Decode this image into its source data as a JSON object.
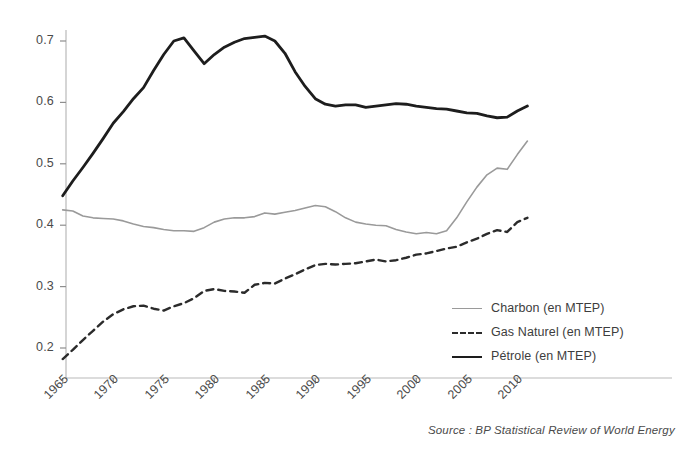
{
  "chart_data": {
    "type": "line",
    "title": "",
    "subtitle": "",
    "xlabel": "",
    "ylabel": "",
    "xlim": [
      1965,
      2011
    ],
    "ylim": [
      0.15,
      0.73
    ],
    "grid": false,
    "legend_position": "inside-right-lower",
    "source_note": "Source : BP Statistical Review of World Energy",
    "xticks": [
      1965,
      1970,
      1975,
      1980,
      1985,
      1990,
      1995,
      2000,
      2005,
      2010
    ],
    "xtick_labels": [
      "1965",
      "1970",
      "1975",
      "1980",
      "1985",
      "1990",
      "1995",
      "2000",
      "2005",
      "2010"
    ],
    "yticks": [
      0.2,
      0.3,
      0.4,
      0.5,
      0.6,
      0.7
    ],
    "ytick_labels": [
      "0.2",
      "0.3",
      "0.4",
      "0.5",
      "0.6",
      "0.7"
    ],
    "x": [
      1965,
      1966,
      1967,
      1968,
      1969,
      1970,
      1971,
      1972,
      1973,
      1974,
      1975,
      1976,
      1977,
      1978,
      1979,
      1980,
      1981,
      1982,
      1983,
      1984,
      1985,
      1986,
      1987,
      1988,
      1989,
      1990,
      1991,
      1992,
      1993,
      1994,
      1995,
      1996,
      1997,
      1998,
      1999,
      2000,
      2001,
      2002,
      2003,
      2004,
      2005,
      2006,
      2007,
      2008,
      2009,
      2010,
      2011
    ],
    "series": [
      {
        "name": "Charbon (en MTEP)",
        "label": "Charbon (en MTEP)",
        "color": "#9a9a9a",
        "style": "solid",
        "width": 1.6,
        "values": [
          0.425,
          0.423,
          0.415,
          0.412,
          0.411,
          0.41,
          0.407,
          0.402,
          0.398,
          0.396,
          0.393,
          0.391,
          0.391,
          0.39,
          0.396,
          0.405,
          0.41,
          0.412,
          0.412,
          0.414,
          0.42,
          0.418,
          0.421,
          0.424,
          0.428,
          0.432,
          0.43,
          0.422,
          0.412,
          0.405,
          0.402,
          0.4,
          0.399,
          0.393,
          0.389,
          0.386,
          0.388,
          0.386,
          0.391,
          0.412,
          0.438,
          0.462,
          0.482,
          0.493,
          0.491,
          0.515,
          0.537
        ]
      },
      {
        "name": "Gas Naturel (en MTEP)",
        "label": "Gas Naturel (en MTEP)",
        "color": "#2b2b2b",
        "style": "dashed",
        "width": 2.4,
        "values": [
          0.182,
          0.197,
          0.213,
          0.228,
          0.243,
          0.255,
          0.263,
          0.268,
          0.269,
          0.264,
          0.261,
          0.268,
          0.273,
          0.281,
          0.293,
          0.296,
          0.293,
          0.292,
          0.29,
          0.303,
          0.306,
          0.305,
          0.313,
          0.32,
          0.328,
          0.335,
          0.337,
          0.336,
          0.337,
          0.338,
          0.341,
          0.344,
          0.341,
          0.343,
          0.347,
          0.352,
          0.354,
          0.358,
          0.362,
          0.365,
          0.372,
          0.378,
          0.386,
          0.392,
          0.389,
          0.405,
          0.412
        ]
      },
      {
        "name": "Pétrole (en MTEP)",
        "label": "Pétrole (en MTEP)",
        "color": "#1d1d1d",
        "style": "solid",
        "width": 2.8,
        "values": [
          0.448,
          0.472,
          0.494,
          0.517,
          0.541,
          0.566,
          0.585,
          0.606,
          0.624,
          0.652,
          0.678,
          0.7,
          0.705,
          0.684,
          0.663,
          0.678,
          0.69,
          0.698,
          0.704,
          0.706,
          0.708,
          0.7,
          0.68,
          0.65,
          0.626,
          0.606,
          0.597,
          0.594,
          0.596,
          0.596,
          0.592,
          0.594,
          0.596,
          0.598,
          0.597,
          0.594,
          0.592,
          0.59,
          0.589,
          0.586,
          0.583,
          0.582,
          0.578,
          0.575,
          0.576,
          0.586,
          0.594
        ]
      }
    ]
  }
}
